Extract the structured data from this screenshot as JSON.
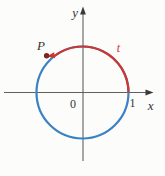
{
  "figure": {
    "labels": {
      "y_axis": "y",
      "x_axis": "x",
      "origin": "0",
      "unit_one": "1",
      "point_p": "P",
      "arc_t": "t"
    },
    "colors": {
      "circle_blue": "#3b82c4",
      "arc_red": "#cf3530",
      "axis_gray": "#606060",
      "arrowhead_dark": "#3a3a3a",
      "label_text": "#333333",
      "point_dot": "#7d2423",
      "background": "#fcfcfa"
    }
  }
}
